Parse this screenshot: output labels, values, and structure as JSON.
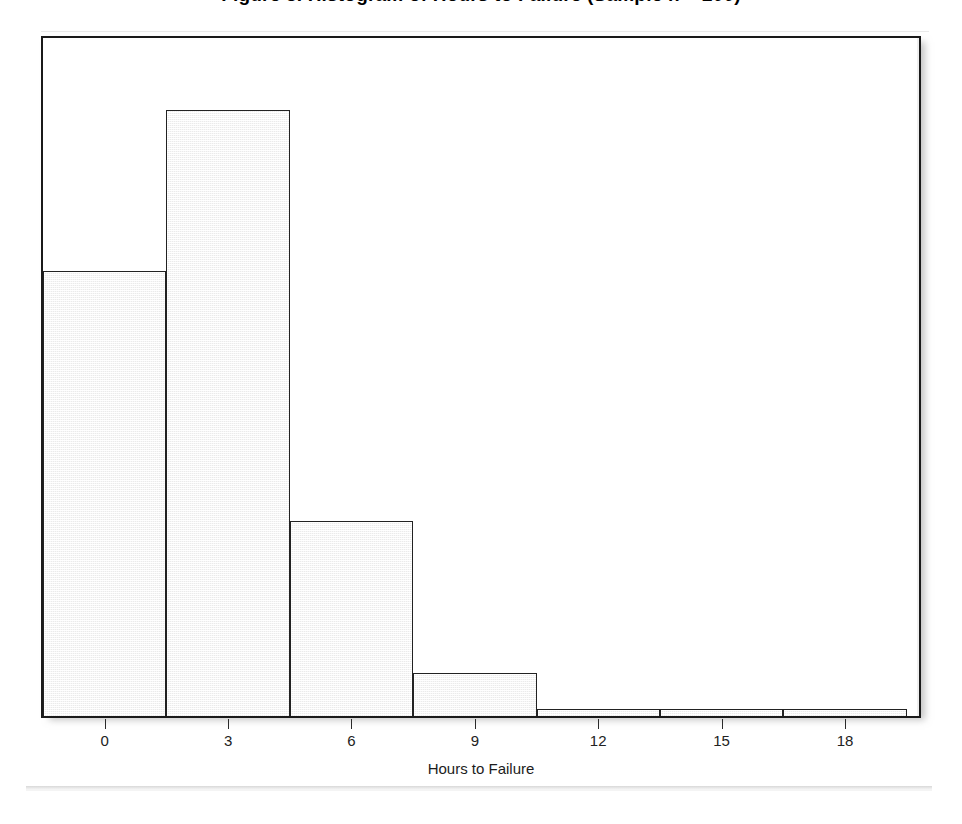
{
  "chart_data": {
    "type": "bar",
    "title": "Figure 3. Histogram of Hours to Failure (Sample n = 200)",
    "subtitle": "",
    "xlabel": "Hours to Failure",
    "ylabel": "",
    "xlim": [
      -1.5,
      19.8
    ],
    "ylim": [
      0,
      76
    ],
    "grid": false,
    "legend": "none",
    "bin_width": 3,
    "bin_edges": [
      -1.5,
      1.5,
      4.5,
      7.5,
      10.5,
      13.5,
      16.5,
      19.5
    ],
    "categories": [
      "-1.5 to 1.5",
      "1.5 to 4.5",
      "4.5 to 7.5",
      "7.5 to 10.5",
      "10.5 to 13.5",
      "13.5 to 16.5",
      "16.5 to 19.5"
    ],
    "values": [
      50,
      68,
      22,
      5,
      1,
      1,
      1
    ],
    "xticks": [
      0,
      3,
      6,
      9,
      12,
      15,
      18
    ],
    "xtick_labels": [
      "0",
      "3",
      "6",
      "9",
      "12",
      "15",
      "18"
    ],
    "yticks": [],
    "ytick_labels": [],
    "bar_color": "#ebebeb",
    "bar_edge_color": "#222222",
    "frame_color": "#1a1a1a",
    "background_color": "#ffffff"
  },
  "figure": {
    "axis_title": "Hours to Failure",
    "title": "Figure 3. Histogram of Hours to Failure (Sample n = 200)"
  }
}
